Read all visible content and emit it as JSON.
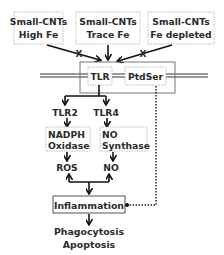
{
  "diagram": {
    "inputs": [
      {
        "line1": "Small-CNTs",
        "line2": "High Fe",
        "blocked": true
      },
      {
        "line1": "Small-CNTs",
        "line2": "Trace Fe",
        "blocked": false
      },
      {
        "line1": "Small-CNTs",
        "line2": "Fe depleted",
        "blocked": true
      }
    ],
    "blocked_marker": "X",
    "receptors": {
      "tlr": "TLR",
      "ptdser": "PtdSer"
    },
    "branches": {
      "left": {
        "receptor": "TLR2",
        "enzyme_line1": "NADPH",
        "enzyme_line2": "Oxidase",
        "product": "ROS"
      },
      "right": {
        "receptor": "TLR4",
        "enzyme_line1": "NO",
        "enzyme_line2": "Synthase",
        "product": "NO"
      }
    },
    "outcome": "Inflammation",
    "results": {
      "line1": "Phagocytosis",
      "line2": "Apoptosis"
    },
    "colors": {
      "text": "#2b2b2b",
      "lines": "#111111",
      "box_border": "#bdbdbd"
    }
  }
}
